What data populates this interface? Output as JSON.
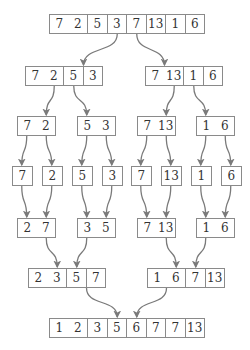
{
  "diagram": {
    "colors": {
      "border": "#8a8a8a",
      "arrow": "#7a7a7a",
      "text": "#333333"
    },
    "rows": [
      {
        "name": "input",
        "groups": [
          [
            7,
            2,
            5,
            3,
            7,
            13,
            1,
            6
          ]
        ]
      },
      {
        "name": "split-halves",
        "groups": [
          [
            7,
            2,
            5,
            3
          ],
          [
            7,
            13,
            1,
            6
          ]
        ]
      },
      {
        "name": "split-pairs",
        "groups": [
          [
            7,
            2
          ],
          [
            5,
            3
          ],
          [
            7,
            13
          ],
          [
            1,
            6
          ]
        ]
      },
      {
        "name": "singletons",
        "groups": [
          [
            7
          ],
          [
            2
          ],
          [
            5
          ],
          [
            3
          ],
          [
            7
          ],
          [
            13
          ],
          [
            1
          ],
          [
            6
          ]
        ]
      },
      {
        "name": "merged-pairs",
        "groups": [
          [
            2,
            7
          ],
          [
            3,
            5
          ],
          [
            7,
            13
          ],
          [
            1,
            6
          ]
        ]
      },
      {
        "name": "merged-halves",
        "groups": [
          [
            2,
            3,
            5,
            7
          ],
          [
            1,
            6,
            7,
            13
          ]
        ]
      },
      {
        "name": "output",
        "groups": [
          [
            1,
            2,
            3,
            5,
            6,
            7,
            7,
            13
          ]
        ]
      }
    ]
  }
}
